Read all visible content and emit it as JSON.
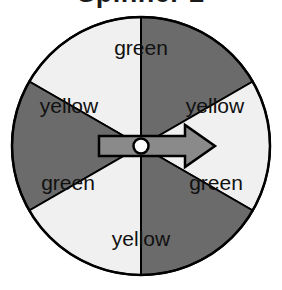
{
  "title": "Spinner 2",
  "colors": {
    "background": "#ffffff",
    "dark_sector": "#6b6b6b",
    "light_sector": "#f0f0f0",
    "outline": "#000000",
    "label_text": "#111111",
    "arrow_fill": "#8a8a8a",
    "pivot_fill": "#ffffff"
  },
  "spinner": {
    "center_x": 141,
    "center_y": 146,
    "radius": 129,
    "sector_count": 6,
    "sector_angle_degrees": 60,
    "arrow_direction": "right",
    "arrow_angle_degrees": 0,
    "sectors": [
      {
        "label": "green",
        "shade": "dark",
        "start_angle": -90,
        "end_angle": -30,
        "label_x": 141,
        "label_y": 49
      },
      {
        "label": "yellow",
        "shade": "light",
        "start_angle": -150,
        "end_angle": -90,
        "label_x": 69,
        "label_y": 107
      },
      {
        "label": "yellow",
        "shade": "light",
        "start_angle": -30,
        "end_angle": 30,
        "label_x": 215,
        "label_y": 107
      },
      {
        "label": "green",
        "shade": "dark",
        "start_angle": 150,
        "end_angle": 210,
        "label_x": 68,
        "label_y": 184
      },
      {
        "label": "green",
        "shade": "dark",
        "start_angle": 30,
        "end_angle": 90,
        "label_x": 216,
        "label_y": 184
      },
      {
        "label": "yellow",
        "shade": "light",
        "start_angle": 90,
        "end_angle": 150,
        "label_x": 141,
        "label_y": 240
      }
    ],
    "outcome_labels": [
      "green",
      "yellow",
      "yellow",
      "green",
      "green",
      "yellow"
    ]
  }
}
